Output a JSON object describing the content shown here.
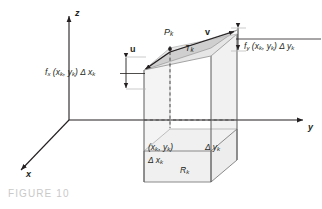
{
  "figure": {
    "caption": "FIGURE 10",
    "caption_color": "#c9c9c9",
    "background_color": "#ffffff",
    "line_color": "#231f20",
    "shade_color": "#ebebeb",
    "tangent_plane_color": "#d8d8d8"
  },
  "axes": {
    "z_label": "z",
    "y_label": "y",
    "x_label": "x"
  },
  "vectors": {
    "u_label": "u",
    "v_label": "v"
  },
  "points": {
    "p_k": "P",
    "p_k_sub": "k",
    "t_k": "T",
    "t_k_sub": "k"
  },
  "labels": {
    "fx": {
      "fn": "f",
      "fn_sub": "x",
      "args": "(x",
      "args_sub1": "k",
      "args_mid": ", y",
      "args_sub2": "k",
      "args_end": ")",
      "delta": "Δ x",
      "delta_sub": "k",
      "full_text": "fx (xk, yk) Δxk"
    },
    "fy": {
      "fn": "f",
      "fn_sub": "y",
      "args": "(x",
      "args_sub1": "k",
      "args_mid": ", y",
      "args_sub2": "k",
      "args_end": ")",
      "delta": "Δ y",
      "delta_sub": "k",
      "full_text": "fy (xk, yk) Δyk"
    },
    "point_xy": {
      "open": "(x",
      "sub1": "k",
      "mid": ", y",
      "sub2": "k",
      "close": ")",
      "full_text": "(xk, yk)"
    },
    "delta_x": {
      "sym": "Δ x",
      "sub": "k",
      "full_text": "Δxk"
    },
    "delta_y": {
      "sym": "Δ y",
      "sub": "k",
      "full_text": "Δyk"
    },
    "region": {
      "sym": "R",
      "sub": "k",
      "full_text": "Rk"
    }
  }
}
